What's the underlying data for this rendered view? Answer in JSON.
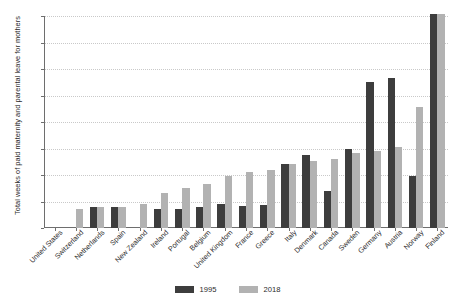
{
  "chart_data": {
    "type": "bar",
    "title": "",
    "subtitle": "",
    "xlabel": "",
    "ylabel": "Total weeks of paid maternity and parental leave for mothers",
    "ylim": [
      0,
      160
    ],
    "ytick_labels": [
      "0",
      "20",
      "40",
      "60",
      "80",
      "100",
      "120",
      "140",
      "160"
    ],
    "ytick_values": [
      0,
      20,
      40,
      60,
      80,
      100,
      120,
      140,
      160
    ],
    "grid": true,
    "legend_position": "bottom-center",
    "categories": [
      "United States",
      "Switzerland",
      "Netherlands",
      "Spain",
      "New Zealand",
      "Ireland",
      "Portugal",
      "Belgium",
      "United Kingdom",
      "France",
      "Greece",
      "Italy",
      "Denmark",
      "Canada",
      "Sweden",
      "Germany",
      "Austria",
      "Norway",
      "Finland"
    ],
    "series": [
      {
        "name": "1995",
        "color": "#3d3d3d",
        "values": [
          0,
          0,
          16,
          16,
          0,
          14,
          14,
          15.5,
          18.5,
          16.5,
          17,
          48.5,
          55,
          28,
          60,
          110.5,
          113.5,
          39,
          161.5
        ]
      },
      {
        "name": "2018",
        "color": "#b2b2b2",
        "values": [
          0,
          14,
          16,
          16,
          18.5,
          26.5,
          30.5,
          33,
          39.5,
          42,
          43.5,
          48.5,
          50.5,
          52,
          56.5,
          58.5,
          61,
          91.5,
          161.5
        ]
      }
    ]
  },
  "axis": {
    "y_title": "Total weeks of paid maternity and parental leave for mothers"
  },
  "legend": {
    "items": [
      {
        "label": "1995",
        "color": "#3d3d3d"
      },
      {
        "label": "2018",
        "color": "#b2b2b2"
      }
    ]
  },
  "colors": {
    "series_1995": "#3d3d3d",
    "series_2018": "#b2b2b2",
    "axis": "#6e6e6e",
    "grid": "#c9c9c9",
    "text": "#2b2b2b",
    "background": "#ffffff"
  }
}
